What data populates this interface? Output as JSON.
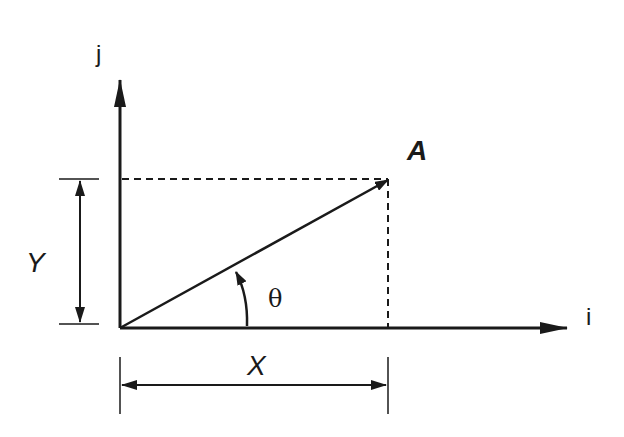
{
  "diagram": {
    "labels": {
      "j_axis": "j",
      "i_axis": "i",
      "vector": "A",
      "y_component": "Y",
      "x_component": "X",
      "angle": "θ"
    },
    "colors": {
      "stroke": "#1a1a1a",
      "background": "#ffffff"
    }
  }
}
